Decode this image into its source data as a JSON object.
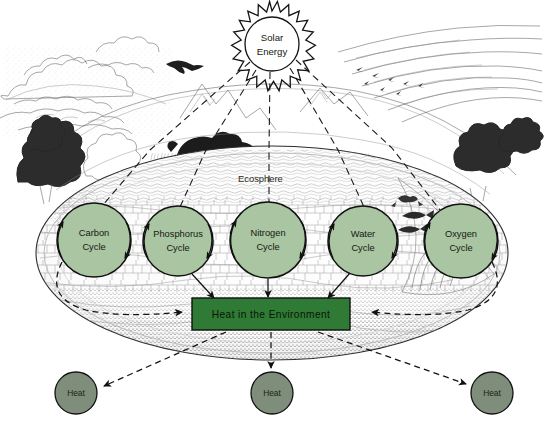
{
  "diagram": {
    "region_label": "Ecosphere",
    "colors": {
      "cycle_fill": "#a9c5a2",
      "heat_box_fill": "#2f7a35",
      "heat_circle_fill": "#7e8e7a",
      "outline": "#111111",
      "background": "#ffffff"
    }
  },
  "solar": {
    "line1": "Solar",
    "line2": "Energy",
    "icon": "sun-icon"
  },
  "cycles": [
    {
      "id": "carbon",
      "line1": "Carbon",
      "line2": "Cycle",
      "cx": 94,
      "cy": 240,
      "r": 37
    },
    {
      "id": "phosphorus",
      "line1": "Phosphorus",
      "line2": "Cycle",
      "cx": 178,
      "cy": 241,
      "r": 35
    },
    {
      "id": "nitrogen",
      "line1": "Nitrogen",
      "line2": "Cycle",
      "cx": 268,
      "cy": 240,
      "r": 38
    },
    {
      "id": "water",
      "line1": "Water",
      "line2": "Cycle",
      "cx": 363,
      "cy": 241,
      "r": 35
    },
    {
      "id": "oxygen",
      "line1": "Oxygen",
      "line2": "Cycle",
      "cx": 461,
      "cy": 241,
      "r": 37
    }
  ],
  "heat_box": {
    "label": "Heat in the Environment"
  },
  "heat_outputs": [
    {
      "id": "heat-left",
      "label": "Heat",
      "cx": 76,
      "cy": 393,
      "r": 21
    },
    {
      "id": "heat-center",
      "label": "Heat",
      "cx": 272,
      "cy": 393,
      "r": 21
    },
    {
      "id": "heat-right",
      "label": "Heat",
      "cx": 492,
      "cy": 393,
      "r": 21
    }
  ],
  "scene_elements": [
    "cumulus-clouds-icon",
    "cirrus-clouds-icon",
    "mountain-range-icon",
    "bear-icon",
    "eagle-icon",
    "bird-flock-icon",
    "duck-icon",
    "fish-icon",
    "frog-icon",
    "conifer-tree-icon",
    "deciduous-tree-icon",
    "grass-icon",
    "rock-strata-icon",
    "soil-cross-section-icon",
    "pond-icon"
  ]
}
